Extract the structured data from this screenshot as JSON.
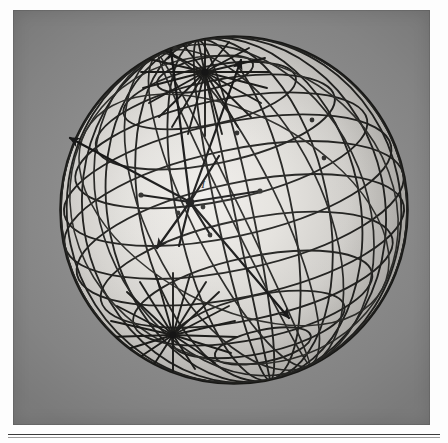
{
  "figure": {
    "kind": "photographic-plate",
    "caption_label": "",
    "plate_background_color": "#8b8b8b",
    "page_background_color": "#fdfdfd",
    "ink_color": "#141414",
    "sphere_fill_highlight": "#eceae6",
    "sphere_fill_edge": "#a9a7a3"
  },
  "sphere": {
    "name": "wireframe-celestial-sphere",
    "center_x": 221,
    "center_y": 200,
    "radius": 174,
    "north_pole": {
      "x": 192,
      "y": 62,
      "label": ""
    },
    "south_pole": {
      "x": 160,
      "y": 325,
      "label": ""
    },
    "tilt_degrees": 18,
    "parallels_count": 11,
    "meridians_count": 24,
    "secondary_grid": {
      "name": "oblique-great-circle-family",
      "circles_count": 9,
      "tilt_degrees": 62
    }
  },
  "hub": {
    "name": "central-observer-point",
    "x": 177,
    "y": 192,
    "label": "I",
    "label_x": 190,
    "label_y": 174
  },
  "vectors": [
    {
      "id": "v1",
      "label": "",
      "tip_x": 55,
      "tip_y": 127,
      "arrow": true
    },
    {
      "id": "v2",
      "label": "",
      "tip_x": 229,
      "tip_y": 48,
      "arrow": true
    },
    {
      "id": "v3",
      "label": "",
      "tip_x": 143,
      "tip_y": 240,
      "arrow": true
    },
    {
      "id": "v4",
      "label": "",
      "tip_x": 278,
      "tip_y": 310,
      "arrow": true
    },
    {
      "id": "v5",
      "label": "",
      "tip_x": 157,
      "tip_y": 37,
      "arrow": false
    },
    {
      "id": "v6",
      "label": "",
      "tip_x": 247,
      "tip_y": 182,
      "arrow": false
    },
    {
      "id": "v7",
      "label": "",
      "tip_x": 128,
      "tip_y": 185,
      "arrow": false
    }
  ],
  "marked_points": [
    {
      "id": "p1",
      "x": 128,
      "y": 185
    },
    {
      "id": "p2",
      "x": 247,
      "y": 181
    },
    {
      "id": "p3",
      "x": 224,
      "y": 123
    },
    {
      "id": "p4",
      "x": 311,
      "y": 148
    },
    {
      "id": "p5",
      "x": 299,
      "y": 110
    },
    {
      "id": "p6",
      "x": 197,
      "y": 225
    },
    {
      "id": "p7",
      "x": 162,
      "y": 38
    },
    {
      "id": "p8",
      "x": 190,
      "y": 197
    },
    {
      "id": "p9",
      "x": 165,
      "y": 203
    }
  ],
  "rule": {
    "name": "page-divider-rule",
    "visible": true
  }
}
